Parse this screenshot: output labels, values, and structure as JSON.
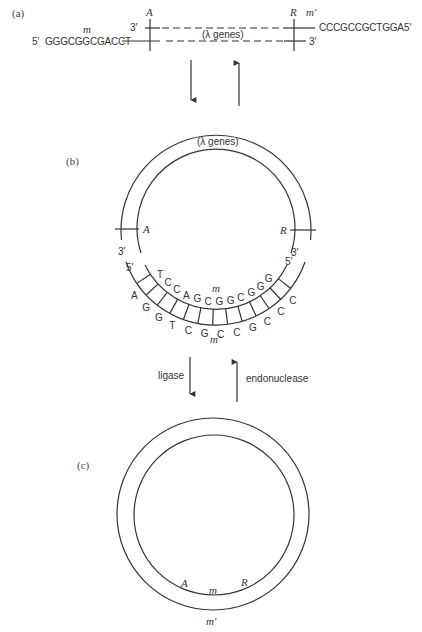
{
  "panel_a": {
    "label": "(a)",
    "top_left_end": "3′",
    "top_strand_seq": "CCCGCCGCTGGA",
    "top_strand_end": "5′",
    "top_strand_name": "m′",
    "bottom_left_end": "5′",
    "bottom_strand_seq": "GGGCGGCGACCT",
    "bottom_strand_name": "m",
    "bottom_right_end": "3′",
    "marker_left": "A",
    "marker_right": "R",
    "genes_label": "(λ genes)"
  },
  "panel_b": {
    "label": "(b)",
    "genes_label": "(λ genes)",
    "marker_left": "A",
    "marker_right": "R",
    "left_outer_end": "3′",
    "left_inner_end": "5′",
    "right_outer_end": "3′",
    "right_inner_end": "5′",
    "inner_strand_name": "m",
    "outer_strand_name": "m′",
    "inner_bases": [
      "T",
      "C",
      "C",
      "A",
      "G",
      "C",
      "G",
      "G",
      "C",
      "G",
      "G",
      "G"
    ],
    "outer_bases": [
      "A",
      "G",
      "G",
      "T",
      "C",
      "G",
      "C",
      "C",
      "G",
      "C",
      "C",
      "C"
    ]
  },
  "panel_c": {
    "label": "(c)",
    "marker_left": "A",
    "marker_right": "R",
    "inner_strand_name": "m",
    "outer_strand_name": "m′"
  },
  "arrows": {
    "ab_down": "",
    "ab_up": "",
    "bc_down_label": "ligase",
    "bc_up_label": "endonuclease"
  }
}
